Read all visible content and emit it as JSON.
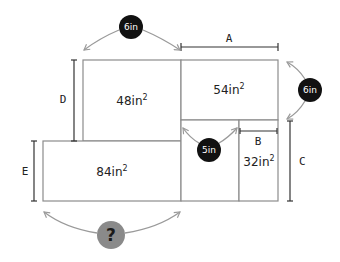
{
  "diagram": {
    "regions": [
      {
        "id": "top-left",
        "area": "48in",
        "sup": "2"
      },
      {
        "id": "top-right",
        "area": "54in",
        "sup": "2"
      },
      {
        "id": "bottom-left",
        "area": "84in",
        "sup": "2"
      },
      {
        "id": "small-right",
        "area": "32in",
        "sup": "2"
      }
    ],
    "dimension_labels": {
      "A": "A",
      "B": "B",
      "C": "C",
      "D": "D",
      "E": "E"
    },
    "badges": {
      "top": "6in",
      "right": "6in",
      "middle": "5in",
      "unknown": "?"
    },
    "colors": {
      "badge_dark": "#111111",
      "badge_unknown": "#8a8a8a",
      "box_stroke": "#8c8c8c",
      "arc_stroke": "#9a9a9a"
    }
  }
}
